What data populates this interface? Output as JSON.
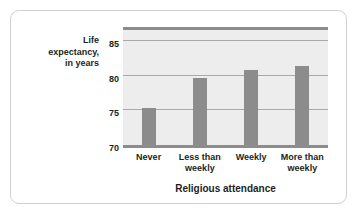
{
  "chart_data": {
    "type": "bar",
    "title": "",
    "categories": [
      "Never",
      "Less than\nweekly",
      "Weekly",
      "More than\nweekly"
    ],
    "values": [
      75.3,
      79.7,
      80.9,
      81.4
    ],
    "xlabel": "Religious attendance",
    "ylabel": "Life\nexpectancy,\nin years",
    "ylim": [
      70,
      87.5
    ],
    "yticks": [
      70,
      75,
      80,
      85
    ],
    "ytick_labels": [
      "70",
      "75",
      "80",
      "85"
    ],
    "grid": true,
    "legend": "none",
    "bar_color": "#8c8c8c",
    "plot_background": "#ededed",
    "gridline_color": "#a9a9a9",
    "axis_color": "#8c8c8c",
    "text_color": "#231f20"
  }
}
